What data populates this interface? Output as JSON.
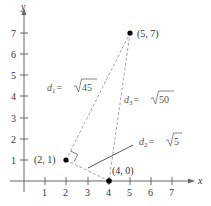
{
  "axes": {
    "x_label": "x",
    "y_label": "y",
    "x_ticks": [
      "1",
      "2",
      "3",
      "4",
      "5",
      "6",
      "7"
    ],
    "y_ticks": [
      "1",
      "2",
      "3",
      "4",
      "5",
      "6",
      "7"
    ]
  },
  "points": [
    {
      "label": "(2, 1)",
      "x": 2,
      "y": 1
    },
    {
      "label": "(5, 7)",
      "x": 5,
      "y": 7
    },
    {
      "label": "(4, 0)",
      "x": 4,
      "y": 0
    }
  ],
  "distances": [
    {
      "name": "d",
      "sub": "1",
      "eq": "=",
      "radicand": "45",
      "between": [
        "(2, 1)",
        "(5, 7)"
      ]
    },
    {
      "name": "d",
      "sub": "2",
      "eq": "=",
      "radicand": "5",
      "between": [
        "(2, 1)",
        "(4, 0)"
      ]
    },
    {
      "name": "d",
      "sub": "3",
      "eq": "=",
      "radicand": "50",
      "between": [
        "(5, 7)",
        "(4, 0)"
      ]
    }
  ],
  "colors": {
    "axis": "#555555",
    "dashed": "#999999",
    "point": "#000000"
  }
}
